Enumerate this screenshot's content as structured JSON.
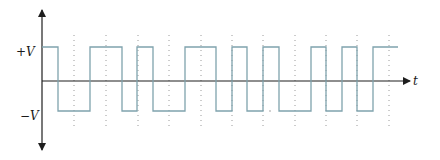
{
  "diagram": {
    "labels": {
      "positive_level": "+V",
      "negative_level": "−V",
      "time_axis": "t"
    },
    "colors": {
      "axis": "#1e1e1e",
      "waveform": "#7fa3ad",
      "gridline": "#9a9a9a",
      "background": "#ffffff"
    },
    "axes": {
      "origin_x": 42,
      "zero_y": 81,
      "y_top": 10,
      "y_bottom": 150,
      "x_end": 410
    },
    "levels": {
      "high_y": 47,
      "low_y": 111
    },
    "waveform": {
      "start_level": "high",
      "transitions_x": [
        58,
        90,
        122,
        137,
        153,
        185,
        216,
        232,
        247,
        263,
        279,
        311,
        326,
        342,
        357,
        373
      ],
      "end_x": 398
    },
    "gridlines": {
      "x": [
        74,
        106,
        138,
        169,
        201,
        232,
        263,
        295,
        326,
        357,
        389
      ],
      "y_start": 35,
      "y_end": 128
    }
  }
}
